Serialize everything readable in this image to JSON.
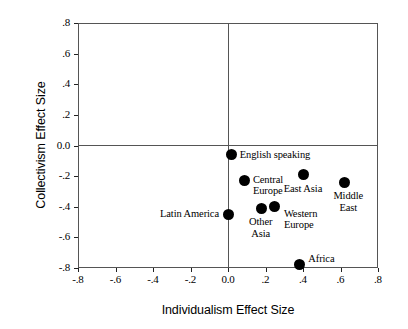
{
  "chart_data": {
    "type": "scatter",
    "title": "",
    "xlabel": "Individualism Effect Size",
    "ylabel": "Collectivism Effect Size",
    "xlim": [
      -0.8,
      0.8
    ],
    "ylim": [
      -0.8,
      0.8
    ],
    "grid": false,
    "legend": "none",
    "xticks": [
      "-.8",
      "-.6",
      "-.4",
      "-.2",
      "0.0",
      ".2",
      ".4",
      ".6",
      ".8"
    ],
    "xtickvalues": [
      -0.8,
      -0.6,
      -0.4,
      -0.2,
      0.0,
      0.2,
      0.4,
      0.6,
      0.8
    ],
    "yticks": [
      ".8",
      ".6",
      ".4",
      ".2",
      "0.0",
      "-.2",
      "-.4",
      "-.6",
      "-.8"
    ],
    "ytickvalues": [
      0.8,
      0.6,
      0.4,
      0.2,
      0.0,
      -0.2,
      -0.4,
      -0.6,
      -0.8
    ],
    "zero_reference_lines": true,
    "marker": "filled-circle",
    "marker_color": "#000000",
    "points": [
      {
        "label": "English speaking",
        "x": 0.02,
        "y": -0.06,
        "label_position": "right",
        "label_dx": 8,
        "label_dy": -6
      },
      {
        "label": "Central\nEurope",
        "x": 0.09,
        "y": -0.23,
        "label_position": "right",
        "label_dx": 8,
        "label_dy": -7
      },
      {
        "label": "East Asia",
        "x": 0.4,
        "y": -0.19,
        "label_position": "center",
        "label_dx": 0,
        "label_dy": 8
      },
      {
        "label": "Middle\nEast",
        "x": 0.62,
        "y": -0.24,
        "label_position": "center",
        "label_dx": 4,
        "label_dy": 8
      },
      {
        "label": "Latin America",
        "x": 0.0,
        "y": -0.45,
        "label_position": "left",
        "label_dx": -9,
        "label_dy": -6
      },
      {
        "label": "Other\nAsia",
        "x": 0.18,
        "y": -0.41,
        "label_position": "center",
        "label_dx": -1,
        "label_dy": 8
      },
      {
        "label": "Western\nEurope",
        "x": 0.25,
        "y": -0.4,
        "label_position": "right",
        "label_dx": 9,
        "label_dy": 1
      },
      {
        "label": "Africa",
        "x": 0.38,
        "y": -0.78,
        "label_position": "right",
        "label_dx": 9,
        "label_dy": -12
      }
    ]
  }
}
